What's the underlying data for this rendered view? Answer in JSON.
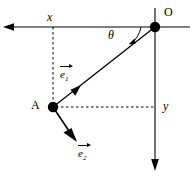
{
  "figure": {
    "background_color": "#ffffff",
    "stroke_color": "#000000",
    "width": 195,
    "height": 178
  },
  "labels": {
    "x_axis": "x",
    "y_axis": "y",
    "origin": "O",
    "point_a": "A",
    "angle": "θ",
    "vector_e1_symbol": "e",
    "vector_e1_subscript": "1",
    "vector_e2_symbol": "e",
    "vector_e2_subscript": "2"
  },
  "geometry": {
    "origin_point": {
      "x": 155,
      "y": 27
    },
    "point_a": {
      "x": 53,
      "y": 107
    },
    "x_axis_line": {
      "x1": 4,
      "y1": 27,
      "x2": 190,
      "y2": 27,
      "arrow": "left"
    },
    "y_axis_line": {
      "x1": 155,
      "y1": 8,
      "x2": 155,
      "y2": 170,
      "arrow": "down"
    },
    "radial_line": {
      "x1": 53,
      "y1": 107,
      "x2": 155,
      "y2": 27
    },
    "vector_e1_arrow_tip": {
      "x": 80,
      "y": 86
    },
    "vector_e2_arrow_tip": {
      "x": 77,
      "y": 141
    },
    "dashed_vertical": {
      "x1": 53,
      "y1": 27,
      "x2": 53,
      "y2": 107
    },
    "dashed_horizontal": {
      "x1": 53,
      "y1": 107,
      "x2": 155,
      "y2": 107
    },
    "angle_arc": {
      "start_x": 141,
      "start_y": 27,
      "end_x": 129,
      "end_y": 42
    },
    "dot_radius": 5
  },
  "styles": {
    "solid_line_width": 1.1,
    "dashed_line_width": 1.0,
    "dash_pattern": "2.5 2.5"
  }
}
